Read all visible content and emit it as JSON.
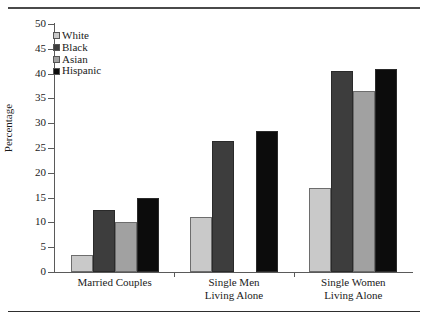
{
  "figure": {
    "rules": {
      "top_label": "top-rule",
      "bottom_label": "bottom-rule"
    }
  },
  "chart_data": {
    "type": "bar",
    "title": "",
    "xlabel": "",
    "ylabel": "Percentage",
    "ylim": [
      0,
      50
    ],
    "yticks": [
      0,
      5,
      10,
      15,
      20,
      25,
      30,
      35,
      40,
      45,
      50
    ],
    "grid": false,
    "legend_position": "top-left",
    "categories": [
      "Married Couples",
      "Single Men\nLiving Alone",
      "Single Women\nLiving Alone"
    ],
    "series": [
      {
        "name": "White",
        "color": "#c9c9c9",
        "values": [
          3.5,
          11.0,
          17.0
        ]
      },
      {
        "name": "Black",
        "color": "#3d3d3d",
        "values": [
          12.5,
          26.5,
          40.5
        ]
      },
      {
        "name": "Asian",
        "color": "#a1a1a1",
        "values": [
          10.0,
          null,
          36.5
        ]
      },
      {
        "name": "Hispanic",
        "color": "#0c0c0c",
        "values": [
          15.0,
          28.5,
          41.0
        ]
      }
    ]
  }
}
